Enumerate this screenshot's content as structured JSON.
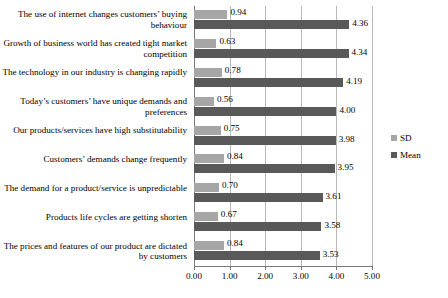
{
  "chart_data": {
    "type": "bar",
    "orientation": "horizontal",
    "title": "",
    "xlabel": "",
    "ylabel": "",
    "xlim": [
      0.0,
      5.0
    ],
    "xticks": [
      "0.00",
      "1.00",
      "2.00",
      "3.00",
      "4.00",
      "5.00"
    ],
    "xtick_values": [
      0.0,
      1.0,
      2.0,
      3.0,
      4.0,
      5.0
    ],
    "grid": true,
    "legend_position": "right",
    "categories": [
      "The use of internet changes customers’ buying behaviour",
      "Growth of business world has created tight market competition",
      "The technology in our industry is changing rapidly",
      "Today’s customers’ have unique demands and preferences",
      "Our products/services have high substitutability",
      "Customers’ demands change frequently",
      "The demand for a product/service is unpredictable",
      "Products life cycles are getting shorten",
      "The prices and features of our product are dictated by customers"
    ],
    "series": [
      {
        "name": "SD",
        "color": "#a6a6a6",
        "values": [
          0.94,
          0.63,
          0.78,
          0.56,
          0.75,
          0.84,
          0.7,
          0.67,
          0.84
        ],
        "labels": [
          "0.94",
          "0.63",
          "0.78",
          "0.56",
          "0.75",
          "0.84",
          "0.70",
          "0.67",
          "0.84"
        ]
      },
      {
        "name": "Mean",
        "color": "#595959",
        "values": [
          4.36,
          4.34,
          4.19,
          4.0,
          3.98,
          3.95,
          3.61,
          3.58,
          3.53
        ],
        "labels": [
          "4.36",
          "4.34",
          "4.19",
          "4.00",
          "3.98",
          "3.95",
          "3.61",
          "3.58",
          "3.53"
        ]
      }
    ]
  },
  "legend": {
    "entries": [
      {
        "label": "SD",
        "color": "#a6a6a6"
      },
      {
        "label": "Mean",
        "color": "#595959"
      }
    ]
  }
}
